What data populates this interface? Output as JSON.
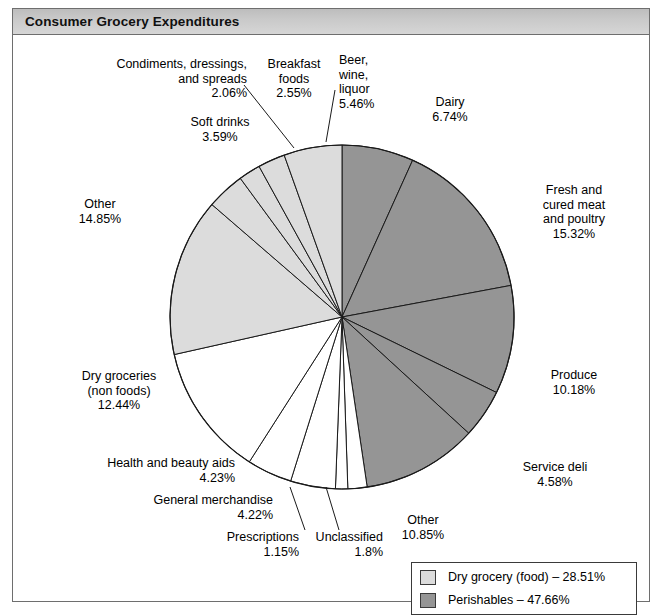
{
  "window": {
    "title": "Consumer Grocery Expenditures"
  },
  "colors": {
    "dry_grocery_food": "#dcdcdc",
    "perishables": "#959595",
    "other_white": "#ffffff",
    "slice_outline": "#1a1a1a",
    "frame_border": "#6e6e6e",
    "title_bar": "#c9c9c9"
  },
  "legend": {
    "items": [
      {
        "label": "Dry grocery (food) – 28.51%",
        "swatch": "#dcdcdc",
        "group": "dry_grocery_food",
        "value": 28.51
      },
      {
        "label": "Perishables – 47.66%",
        "swatch": "#959595",
        "group": "perishables",
        "value": 47.66
      }
    ]
  },
  "chart_data": {
    "type": "pie",
    "title": "Consumer Grocery Expenditures",
    "units": "percent",
    "start_angle_deg": 0,
    "direction": "clockwise",
    "total": 100,
    "legend_position": "bottom-right",
    "grid": false,
    "categories": [
      "Dairy",
      "Fresh and cured meat and poultry",
      "Produce",
      "Service deli",
      "Other (perishables)",
      "Unclassified",
      "Prescriptions",
      "General merchandise",
      "Health and beauty aids",
      "Dry groceries (non foods)",
      "Other (dry grocery)",
      "Soft drinks",
      "Condiments, dressings, and spreads",
      "Breakfast foods",
      "Beer, wine, liquor"
    ],
    "values": [
      6.74,
      15.32,
      10.18,
      4.58,
      10.85,
      1.8,
      1.15,
      4.22,
      4.23,
      12.44,
      14.85,
      3.59,
      2.06,
      2.55,
      5.46
    ],
    "groups": {
      "perishables": {
        "label": "Perishables",
        "total": 47.66,
        "color": "#959595"
      },
      "dry_grocery_food": {
        "label": "Dry grocery (food)",
        "total": 28.51,
        "color": "#dcdcdc"
      },
      "other": {
        "label": "Other",
        "total": 23.83,
        "color": "#ffffff"
      }
    },
    "slices": [
      {
        "name": "Dairy",
        "display_name": "Dairy",
        "value": 6.74,
        "value_label": "6.74%",
        "group": "perishables",
        "color": "#959595"
      },
      {
        "name": "Fresh and cured meat and poultry",
        "display_name": "Fresh and\ncured meat\nand poultry",
        "value": 15.32,
        "value_label": "15.32%",
        "group": "perishables",
        "color": "#959595"
      },
      {
        "name": "Produce",
        "display_name": "Produce",
        "value": 10.18,
        "value_label": "10.18%",
        "group": "perishables",
        "color": "#959595"
      },
      {
        "name": "Service deli",
        "display_name": "Service deli",
        "value": 4.58,
        "value_label": "4.58%",
        "group": "perishables",
        "color": "#959595"
      },
      {
        "name": "Other (perishables)",
        "display_name": "Other",
        "value": 10.85,
        "value_label": "10.85%",
        "group": "perishables",
        "color": "#959595"
      },
      {
        "name": "Unclassified",
        "display_name": "Unclassified",
        "value": 1.8,
        "value_label": "1.8%",
        "group": "other",
        "color": "#ffffff"
      },
      {
        "name": "Prescriptions",
        "display_name": "Prescriptions",
        "value": 1.15,
        "value_label": "1.15%",
        "group": "other",
        "color": "#ffffff"
      },
      {
        "name": "General merchandise",
        "display_name": "General merchandise",
        "value": 4.22,
        "value_label": "4.22%",
        "group": "other",
        "color": "#ffffff"
      },
      {
        "name": "Health and beauty aids",
        "display_name": "Health and beauty aids",
        "value": 4.23,
        "value_label": "4.23%",
        "group": "other",
        "color": "#ffffff"
      },
      {
        "name": "Dry groceries (non foods)",
        "display_name": "Dry groceries\n(non foods)",
        "value": 12.44,
        "value_label": "12.44%",
        "group": "other",
        "color": "#ffffff"
      },
      {
        "name": "Other (dry grocery)",
        "display_name": "Other",
        "value": 14.85,
        "value_label": "14.85%",
        "group": "dry_grocery_food",
        "color": "#dcdcdc"
      },
      {
        "name": "Soft drinks",
        "display_name": "Soft drinks",
        "value": 3.59,
        "value_label": "3.59%",
        "group": "dry_grocery_food",
        "color": "#dcdcdc"
      },
      {
        "name": "Condiments, dressings, and spreads",
        "display_name": "Condiments, dressings,\nand spreads",
        "value": 2.06,
        "value_label": "2.06%",
        "group": "dry_grocery_food",
        "color": "#dcdcdc"
      },
      {
        "name": "Breakfast foods",
        "display_name": "Breakfast\nfoods",
        "value": 2.55,
        "value_label": "2.55%",
        "group": "dry_grocery_food",
        "color": "#dcdcdc"
      },
      {
        "name": "Beer, wine, liquor",
        "display_name": "Beer,\nwine,\nliquor",
        "value": 5.46,
        "value_label": "5.46%",
        "group": "dry_grocery_food",
        "color": "#dcdcdc"
      }
    ]
  },
  "labels": {
    "condiments": {
      "line1": "Condiments, dressings,",
      "line2": "and spreads",
      "line3": "2.06%"
    },
    "breakfast": {
      "line1": "Breakfast",
      "line2": "foods",
      "line3": "2.55%"
    },
    "beer": {
      "line1": "Beer,",
      "line2": "wine,",
      "line3": "liquor",
      "line4": "5.46%"
    },
    "softdrinks": {
      "line1": "Soft drinks",
      "line2": "3.59%"
    },
    "dairy": {
      "line1": "Dairy",
      "line2": "6.74%"
    },
    "meat": {
      "line1": "Fresh and",
      "line2": "cured meat",
      "line3": "and poultry",
      "line4": "15.32%"
    },
    "other_dry": {
      "line1": "Other",
      "line2": "14.85%"
    },
    "produce": {
      "line1": "Produce",
      "line2": "10.18%"
    },
    "drygroceries": {
      "line1": "Dry groceries",
      "line2": "(non foods)",
      "line3": "12.44%"
    },
    "servicedeli": {
      "line1": "Service deli",
      "line2": "4.58%"
    },
    "hba": {
      "line1": "Health and beauty aids",
      "line2": "4.23%"
    },
    "genmerch": {
      "line1": "General merchandise",
      "line2": "4.22%"
    },
    "prescriptions": {
      "line1": "Prescriptions",
      "line2": "1.15%"
    },
    "unclassified": {
      "line1": "Unclassified",
      "line2": "1.8%"
    },
    "other_perish": {
      "line1": "Other",
      "line2": "10.85%"
    }
  }
}
